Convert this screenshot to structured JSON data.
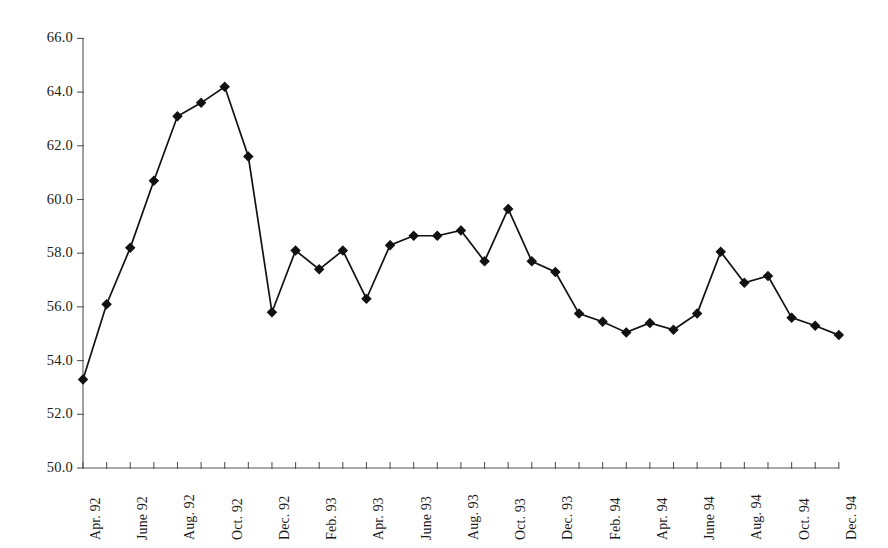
{
  "chart_data": {
    "type": "line",
    "title": "",
    "subtitle": "",
    "xlabel": "",
    "ylabel": "",
    "grid": false,
    "legend": false,
    "legend_position": "none",
    "marker": "filled-diamond",
    "line_color": "#111111",
    "marker_color": "#111111",
    "axis_color": "#555555",
    "ylim": [
      50.0,
      66.0
    ],
    "ytick_step": 2.0,
    "yticks": [
      "50.0",
      "52.0",
      "54.0",
      "56.0",
      "58.0",
      "60.0",
      "62.0",
      "64.0",
      "66.0"
    ],
    "ytick_values": [
      50.0,
      52.0,
      54.0,
      56.0,
      58.0,
      60.0,
      62.0,
      64.0,
      66.0
    ],
    "xticks_labeled": [
      "Apr. 92",
      "June 92",
      "Aug. 92",
      "Oct. 92",
      "Dec. 92",
      "Feb. 93",
      "Apr. 93",
      "June 93",
      "Aug. 93",
      "Oct. 93",
      "Dec. 93",
      "Feb. 94",
      "Apr. 94",
      "June 94",
      "Aug. 94",
      "Oct. 94",
      "Dec. 94"
    ],
    "x": [
      "Apr. 92",
      "May 92",
      "June 92",
      "July 92",
      "Aug. 92",
      "Sept. 92",
      "Oct. 92",
      "Nov. 92",
      "Dec. 92",
      "Jan. 93",
      "Feb. 93",
      "Mar. 93",
      "Apr. 93",
      "May 93",
      "June 93",
      "July 93",
      "Aug. 93",
      "Sept. 93",
      "Oct. 93",
      "Nov. 93",
      "Dec. 93",
      "Jan. 94",
      "Feb. 94",
      "Mar. 94",
      "Apr. 94",
      "May 94",
      "June 94",
      "July 94",
      "Aug. 94",
      "Sept. 94",
      "Oct. 94",
      "Nov. 94",
      "Dec. 94"
    ],
    "values": [
      53.3,
      56.1,
      58.2,
      60.7,
      63.1,
      63.6,
      64.2,
      61.6,
      55.8,
      58.1,
      57.4,
      58.1,
      56.3,
      58.3,
      58.65,
      58.65,
      58.85,
      57.7,
      59.65,
      57.7,
      57.3,
      55.75,
      55.45,
      55.05,
      55.4,
      55.15,
      55.75,
      58.05,
      56.9,
      57.15,
      55.6,
      55.3,
      54.95
    ],
    "series": [
      {
        "name": "series-1",
        "values": [
          53.3,
          56.1,
          58.2,
          60.7,
          63.1,
          63.6,
          64.2,
          61.6,
          55.8,
          58.1,
          57.4,
          58.1,
          56.3,
          58.3,
          58.65,
          58.65,
          58.85,
          57.7,
          59.65,
          57.7,
          57.3,
          55.75,
          55.45,
          55.05,
          55.4,
          55.15,
          55.75,
          58.05,
          56.9,
          57.15,
          55.6,
          55.3,
          54.95
        ]
      }
    ],
    "n_points": 33,
    "min_value": 53.3,
    "max_value": 64.2,
    "first_value": 53.3,
    "last_value": 54.95
  }
}
